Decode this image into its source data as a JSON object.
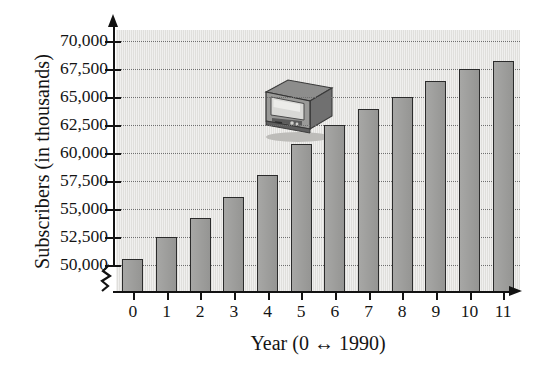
{
  "chart_data": {
    "type": "bar",
    "title": "",
    "subtitle": "",
    "xlabel": "Year (0 ↔ 1990)",
    "ylabel": "Subscribers (in thousands)",
    "categories": [
      "0",
      "1",
      "2",
      "3",
      "4",
      "5",
      "6",
      "7",
      "8",
      "9",
      "10",
      "11"
    ],
    "values": [
      50500,
      52500,
      54200,
      56100,
      58000,
      60800,
      62500,
      63900,
      65000,
      66400,
      67500,
      68200
    ],
    "ylim": [
      50000,
      70000
    ],
    "y_axis_broken": true,
    "y_tick_labels": [
      "70,000",
      "67,500",
      "65,000",
      "62,500",
      "60,000",
      "57,500",
      "55,000",
      "52,500",
      "50,000"
    ],
    "y_tick_values": [
      70000,
      67500,
      65000,
      62500,
      60000,
      57500,
      55000,
      52500,
      50000
    ],
    "grid": true,
    "legend": "none",
    "series": [
      {
        "name": "Subscribers",
        "values": [
          50500,
          52500,
          54200,
          56100,
          58000,
          60800,
          62500,
          63900,
          65000,
          66400,
          67500,
          68200
        ]
      }
    ],
    "colors": {
      "bar_fill": "#9d9d9b",
      "bar_stroke": "#2b2b2b",
      "plot_background": "#e4e3e0",
      "gridline": "#6e6e6e",
      "axis": "#121212",
      "text": "#141414"
    },
    "annotations": [
      {
        "name": "television-illustration",
        "description": "Television set"
      }
    ]
  }
}
